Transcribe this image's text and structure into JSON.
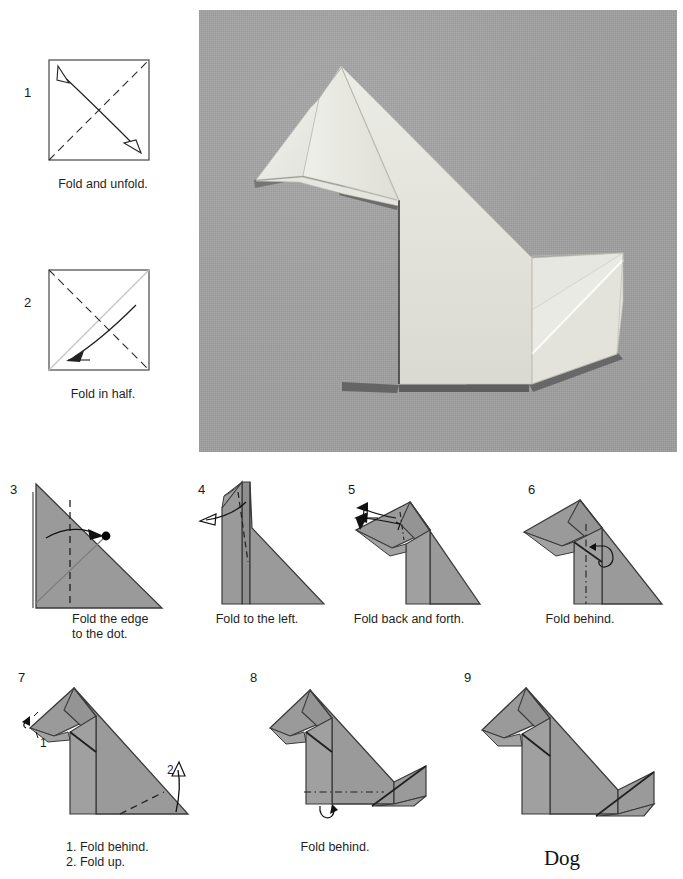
{
  "document": {
    "title": "Dog",
    "model_name": "Dog",
    "paper_color": "#9a9a9a",
    "outline_color": "#3a3a3a",
    "crease_color": "#8e8e8e",
    "photo_background": "#a4a4a4",
    "photo_paper_color": "#ededea"
  },
  "photo": {
    "name": "finished-dog-photograph",
    "alt": "Photograph of the finished folded paper dog on grey background"
  },
  "steps": [
    {
      "number": "1",
      "caption": "Fold and unfold.",
      "diagram": "square-with-diagonal-valley-fold",
      "marks": [
        "dashed-diagonal",
        "double-headed-curved-arrow"
      ]
    },
    {
      "number": "2",
      "caption": "Fold in half.",
      "diagram": "square-with-opposite-diagonal",
      "marks": [
        "dashed-diagonal",
        "existing-crease-line",
        "curved-arrow-to-lower-left"
      ]
    },
    {
      "number": "3",
      "caption": "Fold the edge\nto the dot.",
      "diagram": "right-triangle",
      "marks": [
        "vertical-dashed-fold",
        "grey-crease",
        "black-dot",
        "curved-arrow-right"
      ]
    },
    {
      "number": "4",
      "caption": "Fold to the left.",
      "diagram": "triangle-with-raised-flap",
      "marks": [
        "dashed-fold",
        "long-arrow-left"
      ]
    },
    {
      "number": "5",
      "caption": "Fold back and forth.",
      "diagram": "dog-head-formed",
      "marks": [
        "dash-dot-fold",
        "arrow-down-left",
        "arrow-left"
      ]
    },
    {
      "number": "6",
      "caption": "Fold behind.",
      "diagram": "dog-body-with-head",
      "marks": [
        "vertical-dash-dot-mountain-fold",
        "curved-arrow-behind"
      ]
    },
    {
      "number": "7",
      "caption": "1. Fold behind.\n2. Fold up.",
      "diagram": "dog-with-narrow-body",
      "marks": [
        "nose-arrow-1",
        "dashed-tail-fold",
        "arrow-up-2"
      ],
      "sub_labels": [
        "1",
        "2"
      ]
    },
    {
      "number": "8",
      "caption": "Fold behind.",
      "diagram": "dog-with-tail",
      "marks": [
        "horizontal-dash-dot-fold",
        "curved-arrow-behind"
      ]
    },
    {
      "number": "9",
      "caption": "Dog",
      "diagram": "finished-dog",
      "marks": []
    }
  ]
}
